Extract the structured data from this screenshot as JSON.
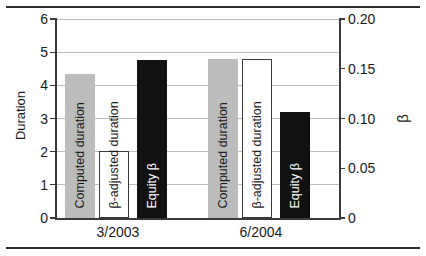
{
  "chart_data": {
    "type": "bar",
    "title": "",
    "categories": [
      "3/2003",
      "6/2004"
    ],
    "series": [
      {
        "name": "Computed duration",
        "axis": "left",
        "style": "gray",
        "values": [
          4.35,
          4.8
        ]
      },
      {
        "name": "β-adjusted duration",
        "axis": "left",
        "style": "white",
        "values": [
          2.02,
          4.8
        ]
      },
      {
        "name": "Equity β",
        "axis": "right",
        "style": "black",
        "values": [
          0.159,
          0.107
        ]
      }
    ],
    "xlabel": "",
    "ylabel": "Duration",
    "ylabel_right": "β",
    "ylim": [
      0,
      6
    ],
    "ylim_right": [
      0,
      0.2
    ],
    "yticks": [
      "0",
      "1",
      "2",
      "3",
      "4",
      "5",
      "6"
    ],
    "yticks_right": [
      "0",
      "0.05",
      "0.10",
      "0.15",
      "0.20"
    ],
    "grid": true,
    "legend": "none-inline-bar-labels"
  },
  "axes": {
    "left": {
      "title": "Duration",
      "ticks": [
        {
          "label": "6",
          "value": 6
        },
        {
          "label": "5",
          "value": 5
        },
        {
          "label": "4",
          "value": 4
        },
        {
          "label": "3",
          "value": 3
        },
        {
          "label": "2",
          "value": 2
        },
        {
          "label": "1",
          "value": 1
        },
        {
          "label": "0",
          "value": 0
        }
      ]
    },
    "right": {
      "title": "β",
      "ticks": [
        {
          "label": "0.20",
          "value": 0.2
        },
        {
          "label": "0.15",
          "value": 0.15
        },
        {
          "label": "0.10",
          "value": 0.1
        },
        {
          "label": "0.05",
          "value": 0.05
        },
        {
          "label": "0",
          "value": 0
        }
      ]
    }
  },
  "groups": [
    {
      "label": "3/2003",
      "bars": [
        {
          "label": "Computed duration",
          "style": "gray",
          "value": 4.35,
          "plot": 4.35
        },
        {
          "label": "β-adjusted duration",
          "style": "white",
          "value": 2.02,
          "plot": 2.02
        },
        {
          "label": "Equity β",
          "style": "black",
          "value": 0.159,
          "plot": 4.77
        }
      ]
    },
    {
      "label": "6/2004",
      "bars": [
        {
          "label": "Computed duration",
          "style": "gray",
          "value": 4.8,
          "plot": 4.8
        },
        {
          "label": "β-adjusted duration",
          "style": "white",
          "value": 4.8,
          "plot": 4.8
        },
        {
          "label": "Equity β",
          "style": "black",
          "value": 0.107,
          "plot": 3.2
        }
      ]
    }
  ],
  "colors": {
    "gray_bar": "#bcbcbc",
    "white_bar": "#ffffff",
    "black_bar": "#111111",
    "gridline": "#bcbcbc",
    "axis": "#3a3a3a",
    "rule": "#2b2b2b",
    "text": "#1a1a1a"
  }
}
